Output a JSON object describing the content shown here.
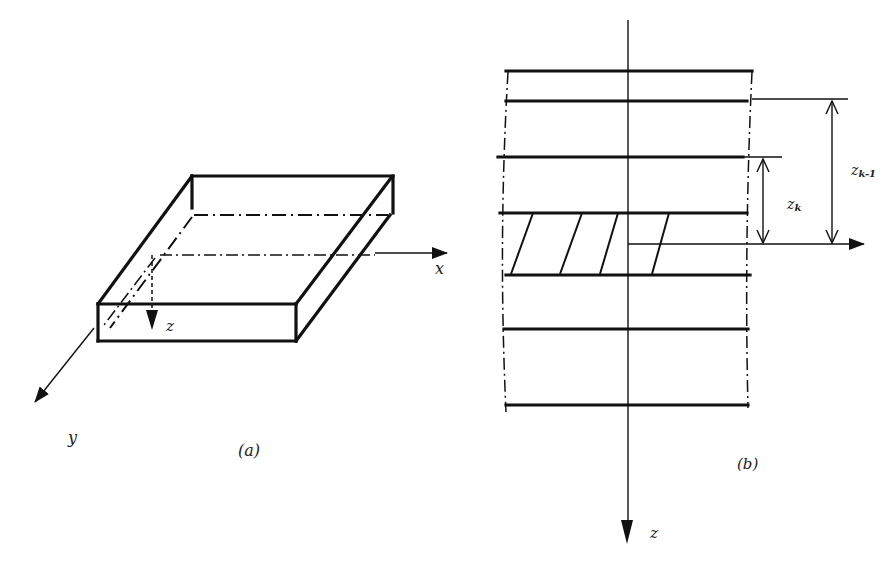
{
  "figure": {
    "panel_a": {
      "caption": "(a)",
      "axes": {
        "x": "x",
        "y": "y",
        "z": "z"
      },
      "description": "Isometric view of a flat plate with mid-plane (dash-dot) and coordinate axes x, y, z"
    },
    "panel_b": {
      "caption": "(b)",
      "axis": {
        "z": "z"
      },
      "layer_count": 6,
      "hatched_layer_index": 3,
      "dimensions": [
        {
          "label": "z",
          "subscript": "k"
        },
        {
          "label": "z",
          "subscript": "k-1"
        }
      ],
      "description": "Cross-section of laminate showing layers, mid-plane reference and distances z_k, z_k-1"
    }
  }
}
